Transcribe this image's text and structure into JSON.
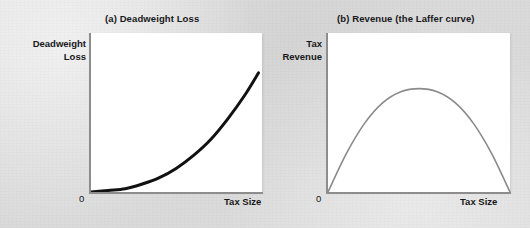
{
  "figure": {
    "background_color": "#dcdcdc",
    "panel_background_color": "#ffffff",
    "axis_color": "#8d8d8d"
  },
  "panels": [
    {
      "id": "a",
      "title": "(a) Deadweight Loss",
      "ylabel": "Deadweight\nLoss",
      "xlabel": "Tax Size",
      "origin_label": "0",
      "curve_color": "#111111",
      "curve_width": "3"
    },
    {
      "id": "b",
      "title": "(b) Revenue (the Laffer curve)",
      "ylabel": "Tax\nRevenue",
      "xlabel": "Tax Size",
      "origin_label": "0",
      "curve_color": "#8a8a8a",
      "curve_width": "1.6"
    }
  ],
  "chart_data": [
    {
      "type": "line",
      "panel": "a",
      "title": "(a) Deadweight Loss",
      "xlabel": "Tax Size",
      "ylabel": "Deadweight Loss",
      "grid": false,
      "legend": "none",
      "xlim": [
        0,
        1
      ],
      "ylim": [
        0,
        1
      ],
      "tick_labels": {
        "x": [
          "0"
        ],
        "y": []
      },
      "annotations": [],
      "series": [
        {
          "name": "Deadweight loss",
          "color": "#111111",
          "description": "Convex increasing curve rising steeply with tax size",
          "x": [
            0.0,
            0.1,
            0.2,
            0.3,
            0.4,
            0.5,
            0.6,
            0.7,
            0.8,
            0.9,
            0.98
          ],
          "y": [
            0.0,
            0.01,
            0.02,
            0.05,
            0.09,
            0.15,
            0.23,
            0.33,
            0.46,
            0.61,
            0.75
          ]
        }
      ]
    },
    {
      "type": "line",
      "panel": "b",
      "title": "(b) Revenue (the Laffer curve)",
      "xlabel": "Tax Size",
      "ylabel": "Tax Revenue",
      "grid": false,
      "legend": "none",
      "xlim": [
        0,
        1
      ],
      "ylim": [
        0,
        1
      ],
      "tick_labels": {
        "x": [
          "0"
        ],
        "y": []
      },
      "annotations": [],
      "series": [
        {
          "name": "Tax revenue",
          "color": "#8a8a8a",
          "description": "Inverted-U Laffer curve peaking at mid tax size and returning to zero",
          "x": [
            0.0,
            0.1,
            0.2,
            0.3,
            0.4,
            0.5,
            0.6,
            0.7,
            0.8,
            0.9,
            1.0
          ],
          "y": [
            0.0,
            0.24,
            0.43,
            0.56,
            0.63,
            0.65,
            0.63,
            0.56,
            0.43,
            0.24,
            0.0
          ]
        }
      ]
    }
  ]
}
